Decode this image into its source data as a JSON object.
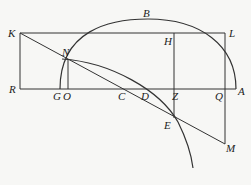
{
  "figure": {
    "width": 251,
    "height": 185,
    "stroke_color": "#333333",
    "background": "#f7f7f5",
    "points": {
      "K": [
        20,
        33
      ],
      "L": [
        225,
        33
      ],
      "R": [
        20,
        89
      ],
      "A": [
        236,
        89
      ],
      "G": [
        60,
        89
      ],
      "O": [
        68,
        89
      ],
      "C": [
        125,
        89
      ],
      "D": [
        148,
        89
      ],
      "Z": [
        174,
        89
      ],
      "Q": [
        225,
        89
      ],
      "H": [
        174,
        33
      ],
      "N": [
        68,
        60
      ],
      "E": [
        174,
        118
      ],
      "M": [
        225,
        144
      ],
      "B": [
        148,
        19
      ]
    },
    "labels": [
      {
        "text": "K",
        "x": 8,
        "y": 28
      },
      {
        "text": "N",
        "x": 62,
        "y": 47
      },
      {
        "text": "B",
        "x": 143,
        "y": 8
      },
      {
        "text": "H",
        "x": 164,
        "y": 36
      },
      {
        "text": "L",
        "x": 229,
        "y": 28
      },
      {
        "text": "R",
        "x": 9,
        "y": 84
      },
      {
        "text": "G",
        "x": 53,
        "y": 91
      },
      {
        "text": "O",
        "x": 63,
        "y": 91
      },
      {
        "text": "C",
        "x": 118,
        "y": 91
      },
      {
        "text": "D",
        "x": 141,
        "y": 91
      },
      {
        "text": "Z",
        "x": 172,
        "y": 91
      },
      {
        "text": "Q",
        "x": 215,
        "y": 91
      },
      {
        "text": "A",
        "x": 238,
        "y": 86
      },
      {
        "text": "E",
        "x": 164,
        "y": 120
      },
      {
        "text": "M",
        "x": 226,
        "y": 143
      }
    ]
  }
}
